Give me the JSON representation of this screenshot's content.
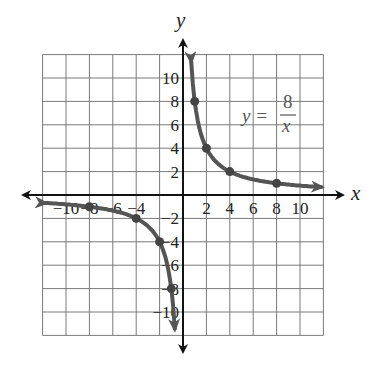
{
  "chart_data": {
    "type": "line",
    "title": "",
    "equation_label": {
      "lhs": "y =",
      "numerator": "8",
      "denominator": "x"
    },
    "xlabel": "x",
    "ylabel": "y",
    "xlim": [
      -12,
      12
    ],
    "ylim": [
      -12,
      12
    ],
    "grid": true,
    "grid_step": 2,
    "x_ticks": [
      -10,
      -8,
      -6,
      -4,
      2,
      4,
      6,
      8,
      10
    ],
    "x_tick_labels": [
      "−10",
      "−8",
      "−6",
      "−4",
      "2",
      "4",
      "6",
      "8",
      "10"
    ],
    "y_ticks": [
      10,
      8,
      6,
      4,
      2,
      -2,
      -4,
      -6,
      -8,
      -10
    ],
    "y_tick_labels": [
      "10",
      "8",
      "6",
      "4",
      "2",
      "−2",
      "−4",
      "−6",
      "−8",
      "−10"
    ],
    "series": [
      {
        "name": "y = 8/x (x > 0 branch)",
        "points": [
          [
            1,
            8
          ],
          [
            2,
            4
          ],
          [
            4,
            2
          ],
          [
            8,
            1
          ]
        ],
        "color": "#555555"
      },
      {
        "name": "y = 8/x (x < 0 branch)",
        "points": [
          [
            -8,
            -1
          ],
          [
            -4,
            -2
          ],
          [
            -2,
            -4
          ],
          [
            -1,
            -8
          ]
        ],
        "color": "#555555"
      }
    ]
  }
}
